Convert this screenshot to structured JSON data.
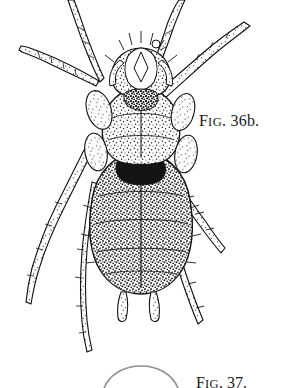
{
  "page": {
    "background_color": "#ffffff",
    "ink_color": "#111111",
    "width": 283,
    "height": 388
  },
  "figure": {
    "caption_prefix": "F",
    "caption_smallcaps": "IG",
    "caption_number": ". 36b.",
    "caption_full": "FIG. 36b.",
    "subject_name": "mite-dorsal-view",
    "view": "dorsal",
    "technique": "stippled pen-and-ink line drawing",
    "parts": [
      {
        "name": "gnathosoma",
        "label": "head-mouthparts"
      },
      {
        "name": "propodosoma",
        "label": "anterior-body-shield"
      },
      {
        "name": "hysterosoma",
        "label": "abdomen"
      },
      {
        "name": "legs",
        "label": "eight-segmented-legs",
        "count": 8
      },
      {
        "name": "setae",
        "label": "barbed-bristles"
      }
    ]
  },
  "next_figure": {
    "caption_prefix": "F",
    "caption_smallcaps": "IG",
    "caption_number": ". 37.",
    "caption_full": "FIG. 37.",
    "note": "top edge of following figure, cropped by page bottom"
  }
}
